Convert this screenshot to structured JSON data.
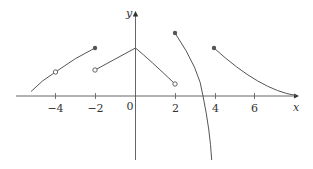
{
  "figure": {
    "type": "piecewise-function-graph",
    "axis_labels": {
      "x": "x",
      "y": "y"
    },
    "origin_label": "0",
    "x_ticks": [
      {
        "value": -4,
        "label": "−4"
      },
      {
        "value": -2,
        "label": "−2"
      },
      {
        "value": 2,
        "label": "2"
      },
      {
        "value": 4,
        "label": "4"
      },
      {
        "value": 6,
        "label": "6"
      }
    ],
    "pieces": [
      {
        "name": "piece-1",
        "from": [
          -5.2,
          0.2
        ],
        "to": [
          -2,
          2.4
        ],
        "through": [
          -4,
          1.2
        ],
        "open_points": [
          [
            -4,
            1.2
          ]
        ],
        "closed_points": [
          [
            -2,
            2.4
          ]
        ]
      },
      {
        "name": "piece-2",
        "from": [
          -2,
          1.3
        ],
        "to": [
          0,
          2.4
        ],
        "shape": "line",
        "open_points": [
          [
            -2,
            1.3
          ]
        ]
      },
      {
        "name": "piece-3",
        "from": [
          0,
          2.4
        ],
        "to": [
          2,
          0.6
        ],
        "shape": "decreasing-concave-up",
        "open_points": [
          [
            2,
            0.6
          ]
        ]
      },
      {
        "name": "piece-4",
        "from": [
          2,
          3.2
        ],
        "to": [
          3.8,
          -3.2
        ],
        "shape": "decreasing-to-negative-infinity",
        "closed_points": [
          [
            2,
            3.2
          ]
        ]
      },
      {
        "name": "piece-5",
        "from": [
          4,
          2.4
        ],
        "to": [
          8,
          0.05
        ],
        "shape": "decreasing-asymptotic",
        "closed_points": [
          [
            4,
            2.4
          ]
        ]
      }
    ],
    "colors": {
      "curve": "#555555",
      "axis": "#555555",
      "text": "#333333"
    }
  }
}
